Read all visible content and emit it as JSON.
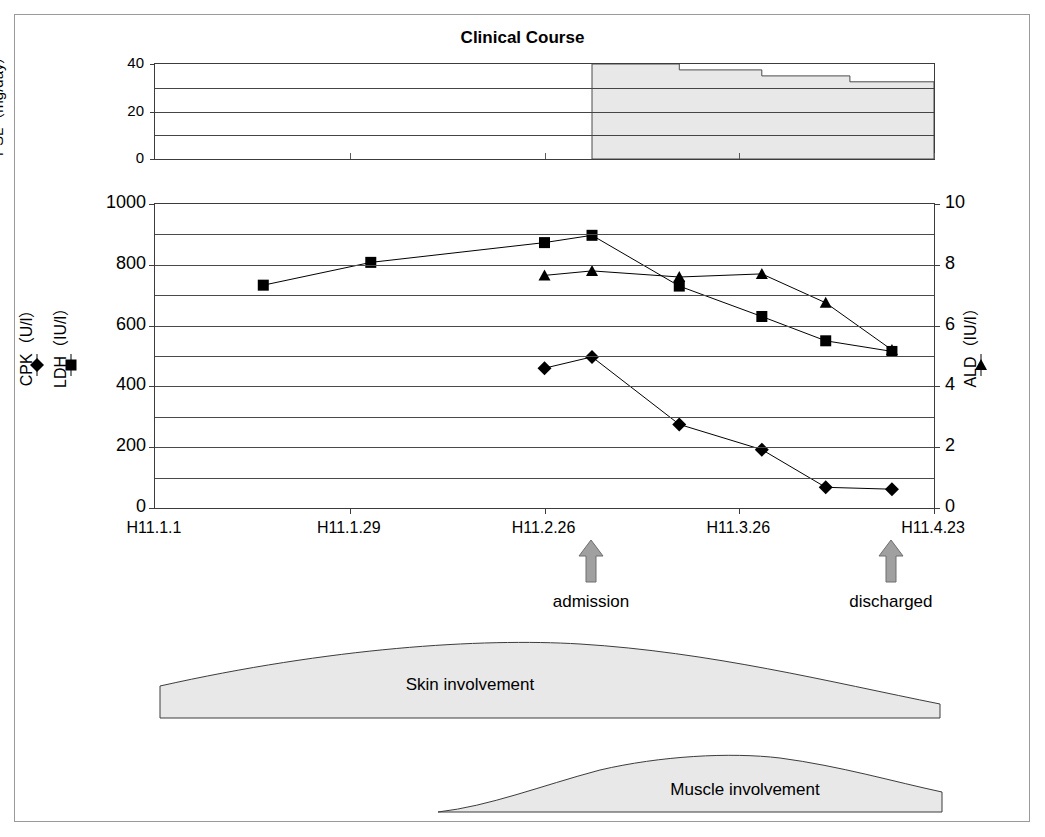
{
  "figure": {
    "title": "Clinical Course",
    "frame_color": "#9a9a9a"
  },
  "psl_panel": {
    "axis_title": "PSL（mg/day）",
    "tick_labels": [
      "0",
      "20",
      "40"
    ],
    "tick_values": [
      0,
      20,
      40
    ],
    "gridline_values": [
      10,
      20,
      30
    ],
    "ylim": [
      0,
      40
    ],
    "fill_color": "#e8e8e8",
    "steps": [
      {
        "start_x_frac": 0.561,
        "end_x_frac": 0.673,
        "value": 40
      },
      {
        "start_x_frac": 0.673,
        "end_x_frac": 0.779,
        "value": 37.5
      },
      {
        "start_x_frac": 0.779,
        "end_x_frac": 0.892,
        "value": 35
      },
      {
        "start_x_frac": 0.892,
        "end_x_frac": 1.0,
        "value": 32.5
      }
    ]
  },
  "main_chart": {
    "left_axis": {
      "tick_labels": [
        "0",
        "200",
        "400",
        "600",
        "800",
        "1000"
      ],
      "tick_values": [
        0,
        200,
        400,
        600,
        800,
        1000
      ],
      "gridline_values": [
        100,
        200,
        300,
        400,
        500,
        600,
        700,
        800,
        900
      ],
      "ylim": [
        0,
        1000
      ]
    },
    "right_axis": {
      "tick_labels": [
        "0",
        "2",
        "4",
        "6",
        "8",
        "10"
      ],
      "tick_values": [
        0,
        2,
        4,
        6,
        8,
        10
      ],
      "ylim": [
        0,
        10
      ]
    },
    "x_axis": {
      "tick_labels": [
        "H11.1.1",
        "H11.1.29",
        "H11.2.26",
        "H11.3.26",
        "H11.4.23"
      ],
      "tick_fracs": [
        0.0,
        0.25,
        0.5,
        0.75,
        1.0
      ]
    },
    "legends": [
      {
        "name": "cpk",
        "label": "CPK（U/l）",
        "marker": "diamond"
      },
      {
        "name": "ldh",
        "label": "LDH（IU/l）",
        "marker": "square"
      },
      {
        "name": "ald",
        "label": "ALD（IU/l）",
        "marker": "triangle"
      }
    ],
    "annotations": [
      {
        "name": "admission",
        "label": "admission",
        "x_frac": 0.561,
        "arrow_color": "#a0a0a0"
      },
      {
        "name": "discharged",
        "label": "discharged",
        "x_frac": 0.946,
        "arrow_color": "#a0a0a0"
      }
    ]
  },
  "chart_data": {
    "type": "line",
    "title": "Clinical Course",
    "xlabel": "",
    "ylabel": "CPK(U/l) / LDH(IU/l)",
    "y2label": "ALD(IU/l)",
    "ylim": [
      0,
      1000
    ],
    "y2lim": [
      0,
      10
    ],
    "grid": true,
    "legend_position": "left-outside-and-right-outside",
    "x_tick_labels": [
      "H11.1.1",
      "H11.1.29",
      "H11.2.26",
      "H11.3.26",
      "H11.4.23"
    ],
    "x_tick_fracs": [
      0.0,
      0.25,
      0.5,
      0.75,
      1.0
    ],
    "series": [
      {
        "name": "LDH(IU/l)",
        "axis": "left",
        "marker": "square",
        "x_fracs": [
          0.139,
          0.277,
          0.5,
          0.561,
          0.673,
          0.779,
          0.861,
          0.946
        ],
        "values": [
          733,
          808,
          873,
          897,
          730,
          630,
          550,
          515
        ]
      },
      {
        "name": "CPK(U/l)",
        "axis": "left",
        "marker": "diamond",
        "x_fracs": [
          0.5,
          0.561,
          0.673,
          0.779,
          0.861,
          0.946
        ],
        "values": [
          460,
          497,
          275,
          192,
          68,
          62
        ]
      },
      {
        "name": "ALD(IU/l)",
        "axis": "right",
        "marker": "triangle",
        "x_fracs": [
          0.5,
          0.561,
          0.673,
          0.779,
          0.861,
          0.946
        ],
        "values": [
          7.65,
          7.8,
          7.6,
          7.7,
          6.75,
          5.2
        ]
      }
    ],
    "psl_series": {
      "name": "PSL(mg/day)",
      "axis": "psl-panel",
      "type": "step-area",
      "ylim": [
        0,
        40
      ],
      "x_fracs": [
        0.561,
        0.673,
        0.779,
        0.892,
        1.0
      ],
      "values": [
        40,
        37.5,
        35,
        32.5,
        32.5
      ]
    },
    "annotations": [
      {
        "text": "admission",
        "x_frac": 0.561
      },
      {
        "text": "discharged",
        "x_frac": 0.946
      },
      {
        "text": "Skin involvement",
        "x_frac": 0.48
      },
      {
        "text": "Muscle involvement",
        "x_frac": 0.72
      }
    ]
  },
  "involvement": {
    "skin": {
      "label": "Skin involvement",
      "fill_color": "#e8e8e8"
    },
    "muscle": {
      "label": "Muscle involvement",
      "fill_color": "#e8e8e8"
    }
  }
}
